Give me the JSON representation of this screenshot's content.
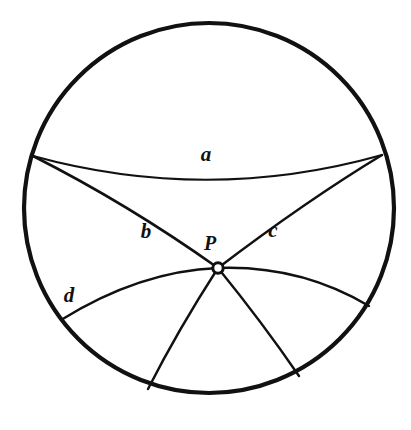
{
  "figure": {
    "type": "geometric-diagram",
    "background_color": "#ffffff",
    "stroke_color": "#111111",
    "boundary": {
      "name": "disk-boundary-circle",
      "center_x": 209,
      "center_y": 208,
      "radius": 185,
      "stroke_width": 4.2
    },
    "point": {
      "label": "P",
      "x": 218,
      "y": 268,
      "marker_radius": 5.2,
      "marker_stroke_width": 3,
      "marker_fill": "#ffffff",
      "label_x": 210,
      "label_y": 245
    },
    "curves": [
      {
        "name": "geodesic-a",
        "label": "a",
        "label_x": 206,
        "label_y": 156,
        "stroke_width": 2.2,
        "path": "M 33 156 Q 208 204 382 155"
      },
      {
        "name": "geodesic-b",
        "label": "b",
        "label_x": 146,
        "label_y": 233,
        "stroke_width": 2.6,
        "path": "M 33 156 Q 128 204 218 268"
      },
      {
        "name": "geodesic-c",
        "label": "c",
        "label_x": 273,
        "label_y": 232,
        "stroke_width": 2.6,
        "path": "M 382 155 Q 306 201 218 268"
      },
      {
        "name": "geodesic-d",
        "label": "d",
        "label_x": 69,
        "label_y": 297,
        "stroke_width": 2.4,
        "path": "M 61 320 Q 140 271 218 268 Q 300 265 369 306"
      },
      {
        "name": "geodesic-ray-lower-left",
        "label": "",
        "stroke_width": 2.4,
        "path": "M 218 268 Q 178 330 148 389"
      },
      {
        "name": "geodesic-ray-lower-right",
        "label": "",
        "stroke_width": 2.4,
        "path": "M 218 268 Q 262 322 299 376"
      }
    ]
  }
}
